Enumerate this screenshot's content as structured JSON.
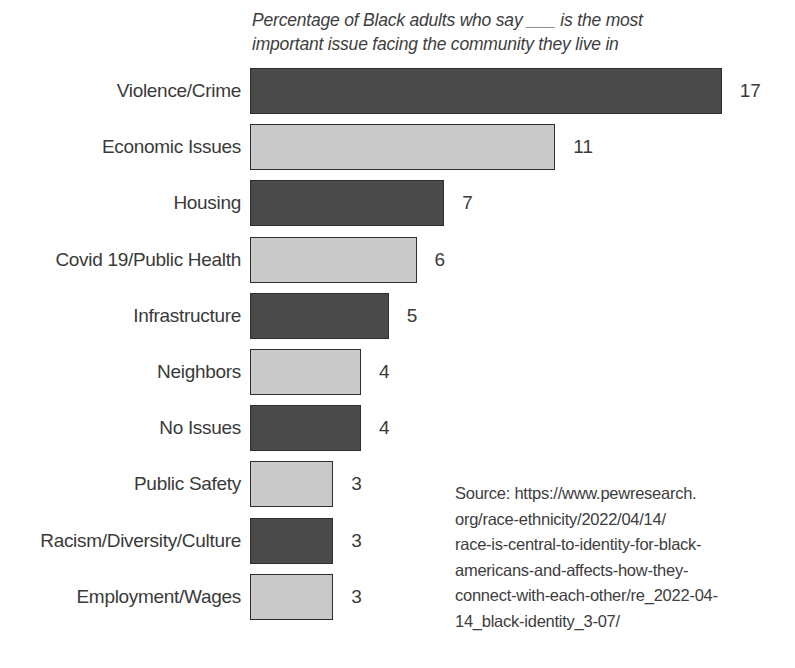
{
  "subtitle": {
    "lines": [
      "Percentage of Black adults who say ___ is the most",
      "important issue facing the community they live in"
    ]
  },
  "source": {
    "lines": [
      "Source: https://www.pewresearch.",
      "org/race-ethnicity/2022/04/14/",
      "race-is-central-to-identity-for-black-",
      "americans-and-affects-how-they-",
      "connect-with-each-other/re_2022-04-",
      "14_black-identity_3-07/"
    ]
  },
  "colors": {
    "bar_dark": "#4a4a4a",
    "bar_light": "#c9c9c9",
    "bar_border": "#2e2e2e",
    "text": "#3a3a3a",
    "background": "#ffffff"
  },
  "chart_data": {
    "type": "bar",
    "orientation": "horizontal",
    "title": "",
    "subtitle": "Percentage of Black adults who say ___ is the most important issue facing the community they live in",
    "xlabel": "",
    "ylabel": "",
    "xlim": [
      0,
      17
    ],
    "grid": false,
    "legend": "none",
    "value_labels": true,
    "categories": [
      "Violence/Crime",
      "Economic Issues",
      "Housing",
      "Covid 19/Public Health",
      "Infrastructure",
      "Neighbors",
      "No Issues",
      "Public Safety",
      "Racism/Diversity/Culture",
      "Employment/Wages"
    ],
    "values": [
      17,
      11,
      7,
      6,
      5,
      4,
      4,
      3,
      3,
      3
    ],
    "bar_shades": [
      "dark",
      "light",
      "dark",
      "light",
      "dark",
      "light",
      "dark",
      "light",
      "dark",
      "light"
    ]
  }
}
